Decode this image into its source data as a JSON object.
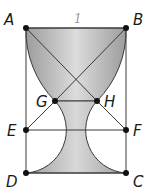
{
  "figure": {
    "side_label": "1",
    "colors": {
      "line": "#3a3a3a",
      "point": "#111111",
      "fill_dark": "#9c9c9c",
      "fill_light": "#dedede",
      "label": "#1a1a1a",
      "side_label": "#9a9a9a"
    },
    "points": [
      {
        "name": "A",
        "x": 26,
        "y": 28,
        "lx": 4,
        "ly": 25
      },
      {
        "name": "B",
        "x": 126,
        "y": 28,
        "lx": 133,
        "ly": 25
      },
      {
        "name": "C",
        "x": 126,
        "y": 173,
        "lx": 133,
        "ly": 187
      },
      {
        "name": "D",
        "x": 26,
        "y": 173,
        "lx": 6,
        "ly": 187
      },
      {
        "name": "E",
        "x": 26,
        "y": 130,
        "lx": 7,
        "ly": 136
      },
      {
        "name": "F",
        "x": 126,
        "y": 130,
        "lx": 133,
        "ly": 136
      },
      {
        "name": "G",
        "x": 55,
        "y": 101,
        "lx": 36,
        "ly": 107
      },
      {
        "name": "H",
        "x": 97,
        "y": 101,
        "lx": 104,
        "ly": 107
      }
    ]
  }
}
